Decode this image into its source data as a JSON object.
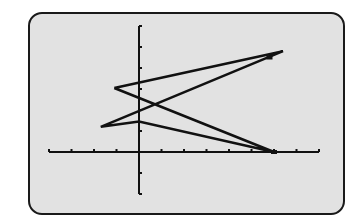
{
  "screen": {
    "background": "#e2e2e2",
    "border": "#1a1a1a",
    "ink": "#111111"
  },
  "chart_data": {
    "type": "line",
    "title": "",
    "xlabel": "",
    "ylabel": "",
    "xlim": [
      -4,
      8
    ],
    "ylim": [
      -2,
      6
    ],
    "xscl": 1,
    "yscl": 1,
    "grid": false,
    "legend": null,
    "series": [
      {
        "name": "connected parametric path",
        "points": [
          {
            "x": -1.1,
            "y": 3.05
          },
          {
            "x": 6.4,
            "y": 4.8
          },
          {
            "x": -1.7,
            "y": 1.2
          },
          {
            "x": 0,
            "y": 1.45
          },
          {
            "x": 6.0,
            "y": 0
          },
          {
            "x": -1.1,
            "y": 3.05
          }
        ]
      }
    ],
    "highlighted_points": [
      {
        "x": 6.0,
        "y": 0
      },
      {
        "x": 5.8,
        "y": 4.5
      }
    ]
  }
}
